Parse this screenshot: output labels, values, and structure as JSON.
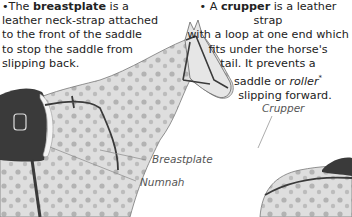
{
  "breastplate_note": {
    "bullet": "•",
    "prefix": "The ",
    "term": "breastplate",
    "lines": [
      "is a",
      "leather neck-strap attached",
      "to the front of the saddle",
      "to stop the saddle from",
      "slipping back."
    ]
  },
  "crupper_note": {
    "bullet": "•",
    "prefix": "A ",
    "term": "crupper",
    "line1_suffix": " is a leather strap",
    "line2": "with a loop at one end which",
    "line3": "fits under the horse's",
    "line4": "tail. It prevents a",
    "line5_prefix": "saddle or ",
    "line5_italic": "roller",
    "line5_mark": "*",
    "line6": "slipping forward."
  },
  "labels": {
    "crupper": "Crupper",
    "breastplate": "Breastplate",
    "numnah": "Numnah"
  },
  "colors": {
    "coat": "#dcdcdc",
    "spots": "#a8a8a8",
    "leather": "#3a3a3a",
    "numnah": "#f4f4f4",
    "leader_line": "#888888"
  }
}
